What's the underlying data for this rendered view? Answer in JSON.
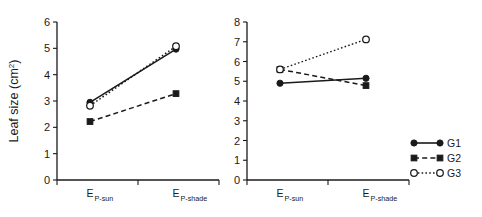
{
  "figure": {
    "background": "#ffffff",
    "foreground": "#1a1a1a"
  },
  "legend": {
    "position": "right",
    "entries": [
      {
        "label": "G1",
        "marker": "filled-circle",
        "line": "solid"
      },
      {
        "label": "G2",
        "marker": "filled-square",
        "line": "dashed"
      },
      {
        "label": "G3",
        "marker": "open-circle",
        "line": "dotted"
      }
    ]
  },
  "chart_data": [
    {
      "type": "line",
      "panel": "left",
      "title": "",
      "xlabel": "",
      "ylabel": "Leaf size (cm2)",
      "ylabel_display": "Leaf size (cm",
      "ylabel_superscript": "2",
      "ylabel_tail": ")",
      "categories": [
        "EP-sun",
        "EP-shade"
      ],
      "category_labels": [
        {
          "main": "E",
          "sub": "P-sun"
        },
        {
          "main": "E",
          "sub": "P-shade"
        }
      ],
      "ylim": [
        0,
        6
      ],
      "yticks": [
        0,
        1,
        2,
        3,
        4,
        5,
        6
      ],
      "ytick_labels": [
        "0",
        "1",
        "2",
        "3",
        "4",
        "5",
        "6"
      ],
      "grid": false,
      "series": [
        {
          "name": "G1",
          "marker": "filled-circle",
          "line": "solid",
          "values": [
            2.95,
            4.97
          ]
        },
        {
          "name": "G2",
          "marker": "filled-square",
          "line": "dashed",
          "values": [
            2.22,
            3.28
          ]
        },
        {
          "name": "G3",
          "marker": "open-circle",
          "line": "dotted",
          "values": [
            2.82,
            5.08
          ]
        }
      ]
    },
    {
      "type": "line",
      "panel": "right",
      "title": "",
      "xlabel": "",
      "ylabel": "",
      "categories": [
        "EP-sun",
        "EP-shade"
      ],
      "category_labels": [
        {
          "main": "E",
          "sub": "P-sun"
        },
        {
          "main": "E",
          "sub": "P-shade"
        }
      ],
      "ylim": [
        0,
        8
      ],
      "yticks": [
        0,
        1,
        2,
        3,
        4,
        5,
        6,
        7,
        8
      ],
      "ytick_labels": [
        "0",
        "1",
        "2",
        "3",
        "4",
        "5",
        "6",
        "7",
        "8"
      ],
      "grid": false,
      "series": [
        {
          "name": "G1",
          "marker": "filled-circle",
          "line": "solid",
          "values": [
            4.9,
            5.15
          ]
        },
        {
          "name": "G2",
          "marker": "filled-square",
          "line": "dashed",
          "values": [
            5.6,
            4.78
          ]
        },
        {
          "name": "G3",
          "marker": "open-circle",
          "line": "dotted",
          "values": [
            5.6,
            7.12
          ]
        }
      ]
    }
  ]
}
